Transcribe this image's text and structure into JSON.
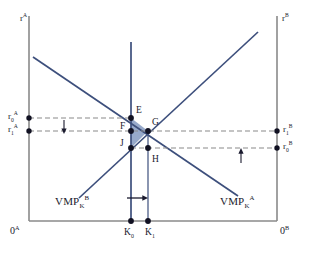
{
  "figure": {
    "type": "economics-diagram",
    "name": "international-capital-market-equilibrium"
  },
  "axes": {
    "left_axis_label": "r",
    "left_axis_sup": "A",
    "right_axis_label": "r",
    "right_axis_sup": "B",
    "origin_left": "0",
    "origin_left_sup": "A",
    "origin_right": "0",
    "origin_right_sup": "B"
  },
  "price_labels": {
    "left_high": {
      "base": "r",
      "sub": "0",
      "sup": "A"
    },
    "left_low": {
      "base": "r",
      "sub": "1",
      "sup": "A"
    },
    "right_high": {
      "base": "r",
      "sub": "1",
      "sup": "B"
    },
    "right_low": {
      "base": "r",
      "sub": "0",
      "sup": "B"
    }
  },
  "curves": [
    {
      "id": "vmp-b",
      "base": "VMP",
      "sub": "K",
      "sup": "B",
      "slope": "upward",
      "label_x": 55,
      "label_y": 203
    },
    {
      "id": "vmp-a",
      "base": "VMP",
      "sub": "K",
      "sup": "A",
      "slope": "downward",
      "label_x": 222,
      "label_y": 203
    }
  ],
  "points": [
    {
      "label": "E",
      "x": 131,
      "y": 118,
      "lx": 136,
      "ly": 110
    },
    {
      "label": "F",
      "x": 131,
      "y": 131,
      "lx": 121,
      "ly": 128
    },
    {
      "label": "G",
      "x": 148,
      "y": 131,
      "lx": 152,
      "ly": 124
    },
    {
      "label": "J",
      "x": 131,
      "y": 148,
      "lx": 122,
      "ly": 145
    },
    {
      "label": "H",
      "x": 148,
      "y": 148,
      "lx": 152,
      "ly": 161
    }
  ],
  "quantity_labels": [
    {
      "base": "K",
      "sub": "0",
      "x": 125,
      "y": 235
    },
    {
      "base": "K",
      "sub": "1",
      "x": 146,
      "y": 235
    }
  ],
  "arrows": {
    "left_down": {
      "direction": "down",
      "x": 64,
      "y_from": 120,
      "y_to": 133
    },
    "right_up": {
      "direction": "up",
      "x": 241,
      "y_from": 163,
      "y_to": 148
    },
    "bottom_right": {
      "direction": "right",
      "y": 198,
      "x_from": 128,
      "x_to": 148
    }
  },
  "shaded_region": {
    "name": "welfare-gain-triangle",
    "vertices": "E-G-J",
    "fill": "#8ea2c6"
  },
  "colors": {
    "curve": "#3d4f7c",
    "axis": "#8a8a8a",
    "dashed": "#8a8a8a",
    "text": "#1a1a2e",
    "shade": "#8ea2c6",
    "background": "#ffffff"
  }
}
